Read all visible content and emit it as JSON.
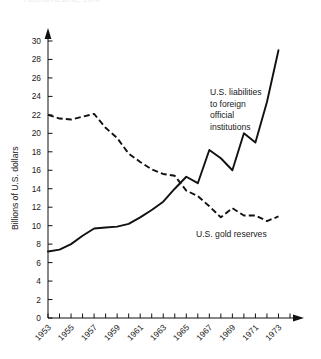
{
  "caption_partial": "Federal Reserve, 1974",
  "chart_data": {
    "type": "line",
    "title": "",
    "xlabel": "",
    "ylabel": "Billions of U.S. dollars",
    "xlim": [
      1953,
      1974
    ],
    "ylim": [
      0,
      31
    ],
    "ytick_step": 2,
    "yticks": [
      0,
      2,
      4,
      6,
      8,
      10,
      12,
      14,
      16,
      18,
      20,
      22,
      24,
      26,
      28,
      30
    ],
    "xticks_labeled": [
      1953,
      1955,
      1957,
      1959,
      1961,
      1963,
      1965,
      1967,
      1969,
      1971,
      1973
    ],
    "xticks_minor_step": 1,
    "grid": false,
    "legend_position": "inline-annotations",
    "x": [
      1953,
      1954,
      1955,
      1956,
      1957,
      1958,
      1959,
      1960,
      1961,
      1962,
      1963,
      1964,
      1965,
      1966,
      1967,
      1968,
      1969,
      1970,
      1971,
      1972,
      1973
    ],
    "series": [
      {
        "name": "U.S. liabilities to foreign official institutions",
        "style": "solid",
        "color": "#111111",
        "values": [
          7.2,
          7.4,
          8.0,
          8.9,
          9.7,
          9.8,
          9.9,
          10.2,
          10.9,
          11.7,
          12.6,
          14.0,
          15.3,
          14.6,
          18.2,
          17.3,
          16.0,
          20.0,
          19.0,
          23.4,
          29.0
        ]
      },
      {
        "name": "U.S. gold reserves",
        "style": "dashed",
        "color": "#111111",
        "values": [
          22.0,
          21.6,
          21.5,
          21.8,
          22.1,
          20.6,
          19.5,
          17.8,
          16.9,
          16.1,
          15.6,
          15.4,
          13.8,
          13.2,
          12.1,
          10.9,
          11.9,
          11.1,
          11.1,
          10.5,
          11.0
        ]
      }
    ],
    "annotations": [
      {
        "name": "liabilities-label",
        "lines": [
          "U.S. liabilities",
          "to foreign",
          "official",
          "institutions"
        ],
        "x_px": 210,
        "y_px": 95
      },
      {
        "name": "gold-reserves-label",
        "lines": [
          "U.S. gold reserves"
        ],
        "x_px": 196,
        "y_px": 237
      }
    ]
  }
}
